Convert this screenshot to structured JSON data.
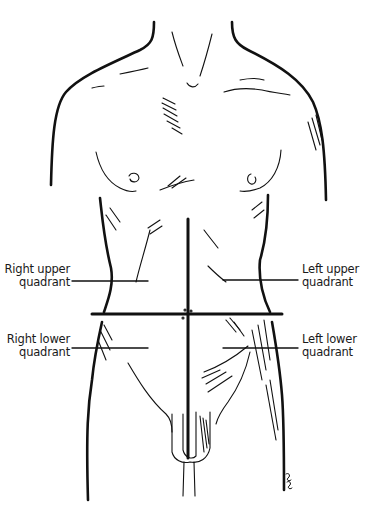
{
  "figure": {
    "type": "anatomical line drawing",
    "ink_color": "#111111",
    "background": "#ffffff",
    "signature": "ppc"
  },
  "labels": {
    "right_upper": {
      "line1": "Right upper",
      "line2": "quadrant"
    },
    "left_upper": {
      "line1": "Left upper",
      "line2": "quadrant"
    },
    "right_lower": {
      "line1": "Right lower",
      "line2": "quadrant"
    },
    "left_lower": {
      "line1": "Left lower",
      "line2": "quadrant"
    }
  },
  "dividers": {
    "vertical_line": {
      "x": 189,
      "y_start": 218,
      "y_end": 458
    },
    "horizontal_line": {
      "y": 314,
      "x_start": 91,
      "x_end": 282
    }
  }
}
